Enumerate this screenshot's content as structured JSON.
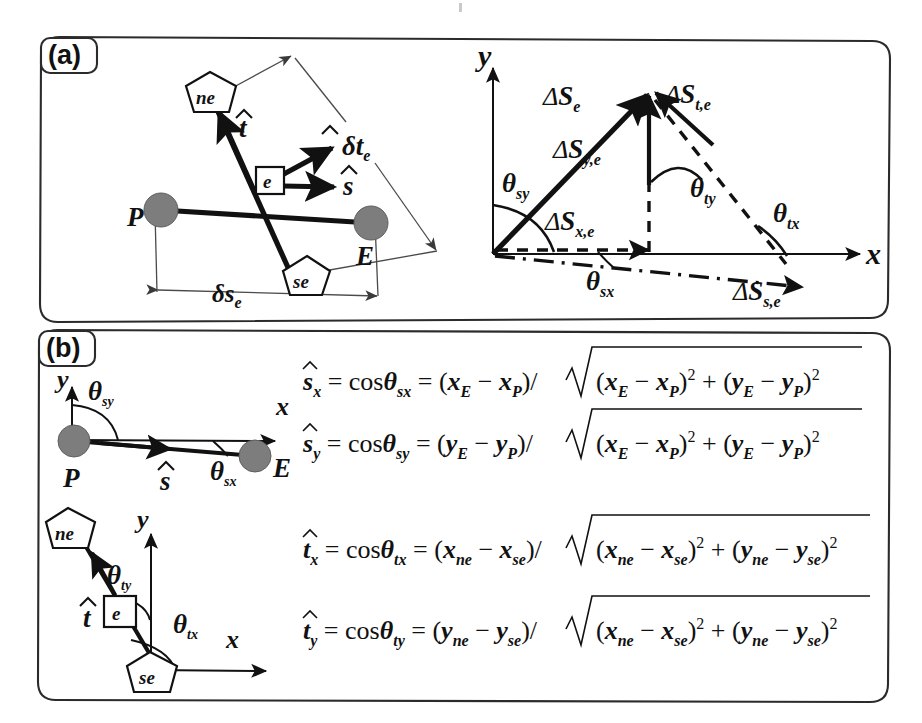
{
  "figure": {
    "type": "scientific-diagram",
    "background_color": "#ffffff",
    "line_color": "#111111",
    "node_fill_color": "#7d7d7d",
    "panels": [
      {
        "tag": "(a)"
      },
      {
        "tag": "(b)"
      }
    ]
  },
  "panel_a": {
    "tag": "(a)",
    "left_diagram": {
      "name": "element-geometry",
      "node_labels": {
        "p": "P",
        "e_box": "e",
        "end": "E"
      },
      "pentagon_labels": {
        "ne": "ne",
        "se": "se"
      },
      "vector_labels": {
        "t_hat": "t",
        "s_hat": "s",
        "n_hat_dt": "n",
        "n_hat_dt_rest": "δt",
        "n_hat_dt_sub": "e"
      },
      "dimension_label": {
        "main": "δs",
        "sub": "e"
      }
    },
    "right_diagram": {
      "name": "displacement-vector-decomposition",
      "axis_x": "x",
      "axis_y": "y",
      "vectors": [
        {
          "name": "delta-S-e",
          "symbol": "ΔS",
          "sub": "e"
        },
        {
          "name": "delta-S-t-e",
          "symbol": "ΔS",
          "sub": "t,e"
        },
        {
          "name": "delta-S-y-e",
          "symbol": "ΔS",
          "sub": "y,e"
        },
        {
          "name": "delta-S-x-e",
          "symbol": "ΔS",
          "sub": "x,e"
        },
        {
          "name": "delta-S-s-e",
          "symbol": "ΔS",
          "sub": "s,e"
        }
      ],
      "angles": [
        {
          "name": "theta-sy",
          "symbol": "θ",
          "sub": "sy"
        },
        {
          "name": "theta-ty",
          "symbol": "θ",
          "sub": "ty"
        },
        {
          "name": "theta-tx",
          "symbol": "θ",
          "sub": "tx"
        },
        {
          "name": "theta-sx",
          "symbol": "θ",
          "sub": "sx"
        }
      ]
    }
  },
  "panel_b": {
    "tag": "(b)",
    "diagram_s": {
      "name": "s-hat-angle-definition",
      "axis_x": "x",
      "axis_y": "y",
      "node_start": "P",
      "node_end": "E",
      "vector": "s",
      "angle_y": {
        "symbol": "θ",
        "sub": "sy"
      },
      "angle_x": {
        "symbol": "θ",
        "sub": "sx"
      }
    },
    "diagram_t": {
      "name": "t-hat-angle-definition",
      "axis_x": "x",
      "axis_y": "y",
      "pentagon_top": "ne",
      "pentagon_bottom": "se",
      "node_box": "e",
      "vector": "t",
      "angle_y": {
        "symbol": "θ",
        "sub": "ty"
      },
      "angle_x": {
        "symbol": "θ",
        "sub": "tx"
      }
    },
    "equations": [
      {
        "name": "s-hat-x",
        "lhs_sym": "s",
        "lhs_sub": "x",
        "cos": "cos",
        "theta": "θ",
        "theta_sub": "sx",
        "num_open": "(",
        "num_a": "x",
        "num_a_sub": "E",
        "minus": "−",
        "num_b": "x",
        "num_b_sub": "P",
        "num_close": ")",
        "slash": "/",
        "rad_a": "x",
        "rad_a_sub": "E",
        "rad_b": "x",
        "rad_b_sub": "P",
        "plus": "+",
        "rad_c": "y",
        "rad_c_sub": "E",
        "rad_d": "y",
        "rad_d_sub": "P",
        "sup": "2"
      },
      {
        "name": "s-hat-y",
        "lhs_sym": "s",
        "lhs_sub": "y",
        "cos": "cos",
        "theta": "θ",
        "theta_sub": "sy",
        "num_open": "(",
        "num_a": "y",
        "num_a_sub": "E",
        "minus": "−",
        "num_b": "y",
        "num_b_sub": "P",
        "num_close": ")",
        "slash": "/",
        "rad_a": "x",
        "rad_a_sub": "E",
        "rad_b": "x",
        "rad_b_sub": "P",
        "plus": "+",
        "rad_c": "y",
        "rad_c_sub": "E",
        "rad_d": "y",
        "rad_d_sub": "P",
        "sup": "2"
      },
      {
        "name": "t-hat-x",
        "lhs_sym": "t",
        "lhs_sub": "x",
        "cos": "cos",
        "theta": "θ",
        "theta_sub": "tx",
        "num_open": "(",
        "num_a": "x",
        "num_a_sub": "ne",
        "minus": "−",
        "num_b": "x",
        "num_b_sub": "se",
        "num_close": ")",
        "slash": "/",
        "rad_a": "x",
        "rad_a_sub": "ne",
        "rad_b": "x",
        "rad_b_sub": "se",
        "plus": "+",
        "rad_c": "y",
        "rad_c_sub": "ne",
        "rad_d": "y",
        "rad_d_sub": "se",
        "sup": "2"
      },
      {
        "name": "t-hat-y",
        "lhs_sym": "t",
        "lhs_sub": "y",
        "cos": "cos",
        "theta": "θ",
        "theta_sub": "ty",
        "num_open": "(",
        "num_a": "y",
        "num_a_sub": "ne",
        "minus": "−",
        "num_b": "y",
        "num_b_sub": "se",
        "num_close": ")",
        "slash": "/",
        "rad_a": "x",
        "rad_a_sub": "ne",
        "rad_b": "x",
        "rad_b_sub": "se",
        "plus": "+",
        "rad_c": "y",
        "rad_c_sub": "ne",
        "rad_d": "y",
        "rad_d_sub": "se",
        "sup": "2"
      }
    ]
  },
  "glyphs": {
    "equals": "=",
    "hat": "ˆ"
  }
}
